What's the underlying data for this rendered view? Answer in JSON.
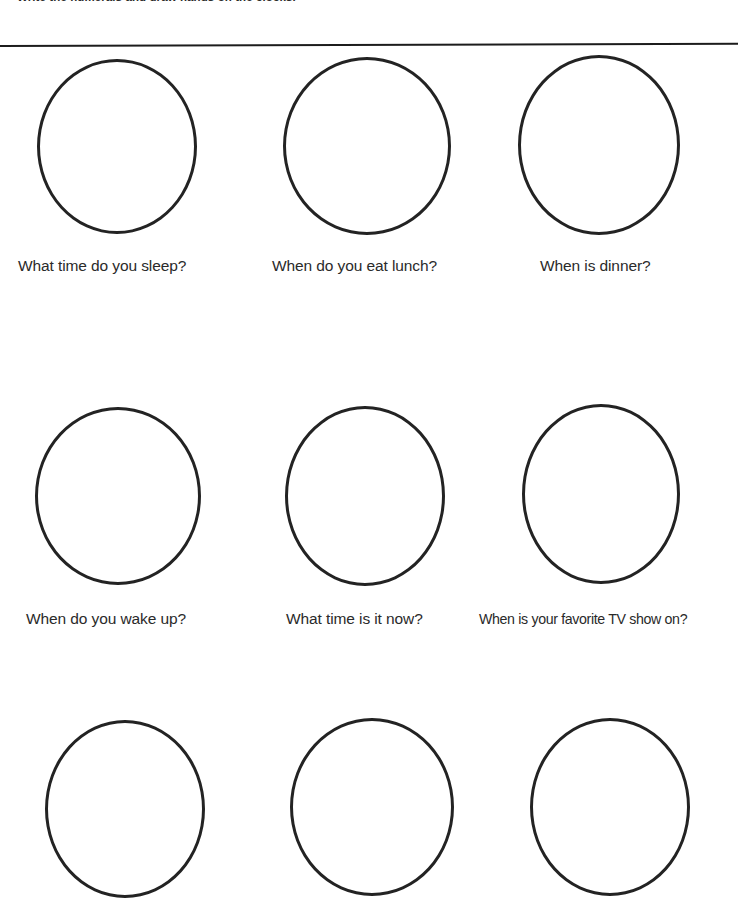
{
  "worksheet": {
    "instruction": "Write the numerals and draw hands on the clocks.",
    "divider": "horizontal-rule",
    "ink_color": "#232323",
    "page_color": "#ffffff"
  },
  "rows": [
    {
      "row_index": 1,
      "clocks": [
        {
          "id": "clock-1",
          "caption": "What time do you sleep?",
          "left": 37,
          "top": 59,
          "width": 160,
          "height": 175,
          "caption_left": 18,
          "caption_top": 257,
          "caption_size": "normal"
        },
        {
          "id": "clock-2",
          "caption": "When do you eat lunch?",
          "left": 283,
          "top": 57,
          "width": 168,
          "height": 178,
          "caption_left": 272,
          "caption_top": 257,
          "caption_size": "normal"
        },
        {
          "id": "clock-3",
          "caption": "When is dinner?",
          "left": 518,
          "top": 55,
          "width": 162,
          "height": 180,
          "caption_left": 540,
          "caption_top": 257,
          "caption_size": "normal"
        }
      ]
    },
    {
      "row_index": 2,
      "clocks": [
        {
          "id": "clock-4",
          "caption": "When do you wake up?",
          "left": 35,
          "top": 407,
          "width": 166,
          "height": 178,
          "caption_left": 26,
          "caption_top": 610,
          "caption_size": "normal"
        },
        {
          "id": "clock-5",
          "caption": "What time is it now?",
          "left": 285,
          "top": 406,
          "width": 160,
          "height": 180,
          "caption_left": 286,
          "caption_top": 610,
          "caption_size": "normal"
        },
        {
          "id": "clock-6",
          "caption": "When is your favorite TV show on?",
          "left": 522,
          "top": 404,
          "width": 158,
          "height": 180,
          "caption_left": 479,
          "caption_top": 611,
          "caption_size": "small"
        }
      ]
    },
    {
      "row_index": 3,
      "clocks": [
        {
          "id": "clock-7",
          "caption": "",
          "left": 45,
          "top": 720,
          "width": 160,
          "height": 178,
          "caption_left": 0,
          "caption_top": 0,
          "caption_size": "normal"
        },
        {
          "id": "clock-8",
          "caption": "",
          "left": 290,
          "top": 718,
          "width": 164,
          "height": 178,
          "caption_left": 0,
          "caption_top": 0,
          "caption_size": "normal"
        },
        {
          "id": "clock-9",
          "caption": "",
          "left": 530,
          "top": 718,
          "width": 160,
          "height": 178,
          "caption_left": 0,
          "caption_top": 0,
          "caption_size": "normal"
        }
      ]
    }
  ]
}
